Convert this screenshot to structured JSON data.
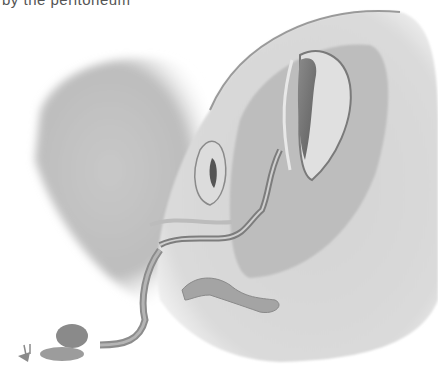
{
  "caption": {
    "text": "by the peritoneum"
  },
  "illustration": {
    "subject": "anatomical cross-section illustration",
    "style": "grayscale pencil shading",
    "colors": {
      "background": "#ffffff",
      "light_tissue": "#d8d8d8",
      "mid_tissue": "#a9a9a9",
      "dark_cavity": "#6e6e6e",
      "outline": "#8a8a8a"
    }
  }
}
